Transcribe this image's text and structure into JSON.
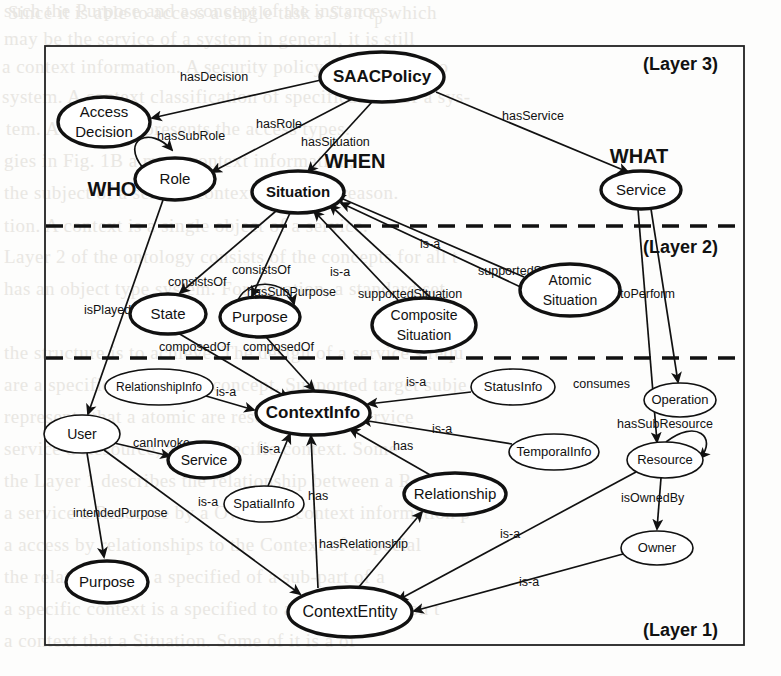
{
  "figure": {
    "width": 781,
    "height": 676,
    "stroke_color": "#111111",
    "fill_color": "#ffffff"
  },
  "layers": [
    {
      "id": "layer3",
      "label": "(Layer 3)",
      "x": 700,
      "y": 64
    },
    {
      "id": "layer2",
      "label": "(Layer 2)",
      "x": 700,
      "y": 247
    },
    {
      "id": "layer1",
      "label": "(Layer 1)",
      "x": 700,
      "y": 630
    }
  ],
  "axis_labels": [
    {
      "id": "who",
      "label": "WHO",
      "x": 112,
      "y": 196
    },
    {
      "id": "when",
      "label": "WHEN",
      "x": 355,
      "y": 168
    },
    {
      "id": "what",
      "label": "WHAT",
      "x": 639,
      "y": 163
    }
  ],
  "nodes": [
    {
      "id": "saacpolicy",
      "label": "SAACPolicy",
      "lines": [
        "SAACPolicy"
      ],
      "cx": 382,
      "cy": 77,
      "rx": 62,
      "ry": 25,
      "weight": "thick",
      "font": 17
    },
    {
      "id": "accessdecision",
      "label": "Access Decision",
      "lines": [
        "Access",
        "Decision"
      ],
      "cx": 104,
      "cy": 122,
      "rx": 46,
      "ry": 25,
      "weight": "thick",
      "font": 15
    },
    {
      "id": "role",
      "label": "Role",
      "lines": [
        "Role"
      ],
      "cx": 175,
      "cy": 179,
      "rx": 40,
      "ry": 21,
      "weight": "thick",
      "font": 15
    },
    {
      "id": "situation",
      "label": "Situation",
      "lines": [
        "Situation"
      ],
      "cx": 298,
      "cy": 192,
      "rx": 46,
      "ry": 21,
      "weight": "thick",
      "font": 15
    },
    {
      "id": "service_l3",
      "label": "Service",
      "lines": [
        "Service"
      ],
      "cx": 641,
      "cy": 190,
      "rx": 40,
      "ry": 19,
      "weight": "thick",
      "font": 15
    },
    {
      "id": "state",
      "label": "State",
      "lines": [
        "State"
      ],
      "cx": 168,
      "cy": 314,
      "rx": 38,
      "ry": 20,
      "weight": "thick",
      "font": 15
    },
    {
      "id": "purpose_l2",
      "label": "Purpose",
      "lines": [
        "Purpose"
      ],
      "cx": 260,
      "cy": 317,
      "rx": 40,
      "ry": 20,
      "weight": "thick",
      "font": 15
    },
    {
      "id": "compositesituation",
      "label": "Composite Situation",
      "lines": [
        "Composite",
        "Situation"
      ],
      "cx": 424,
      "cy": 325,
      "rx": 52,
      "ry": 27,
      "weight": "thick",
      "font": 14
    },
    {
      "id": "atomicsituation",
      "label": "Atomic Situation",
      "lines": [
        "Atomic",
        "Situation"
      ],
      "cx": 570,
      "cy": 290,
      "rx": 50,
      "ry": 26,
      "weight": "thick",
      "font": 14
    },
    {
      "id": "operation",
      "label": "Operation",
      "lines": [
        "Operation"
      ],
      "cx": 680,
      "cy": 400,
      "rx": 36,
      "ry": 17,
      "weight": "thin",
      "font": 13
    },
    {
      "id": "relationshipinfo",
      "label": "RelationshipInfo",
      "lines": [
        "RelationshipInfo"
      ],
      "cx": 159,
      "cy": 387,
      "rx": 54,
      "ry": 18,
      "weight": "thin",
      "font": 12
    },
    {
      "id": "contextinfo",
      "label": "ContextInfo",
      "lines": [
        "ContextInfo"
      ],
      "cx": 313,
      "cy": 413,
      "rx": 57,
      "ry": 22,
      "weight": "thick",
      "font": 17
    },
    {
      "id": "statusinfo",
      "label": "StatusInfo",
      "lines": [
        "StatusInfo"
      ],
      "cx": 513,
      "cy": 387,
      "rx": 42,
      "ry": 18,
      "weight": "thin",
      "font": 13
    },
    {
      "id": "user",
      "label": "User",
      "lines": [
        "User"
      ],
      "cx": 82,
      "cy": 434,
      "rx": 38,
      "ry": 19,
      "weight": "thin",
      "font": 14
    },
    {
      "id": "service_l1",
      "label": "Service",
      "lines": [
        "Service"
      ],
      "cx": 204,
      "cy": 460,
      "rx": 36,
      "ry": 18,
      "weight": "thick",
      "font": 14
    },
    {
      "id": "temporalinfo",
      "label": "TemporalInfo",
      "lines": [
        "TemporalInfo"
      ],
      "cx": 554,
      "cy": 452,
      "rx": 45,
      "ry": 18,
      "weight": "thin",
      "font": 13
    },
    {
      "id": "resource",
      "label": "Resource",
      "lines": [
        "Resource"
      ],
      "cx": 665,
      "cy": 460,
      "rx": 38,
      "ry": 18,
      "weight": "thin",
      "font": 13
    },
    {
      "id": "spatialinfo",
      "label": "SpatialInfo",
      "lines": [
        "SpatialInfo"
      ],
      "cx": 264,
      "cy": 504,
      "rx": 40,
      "ry": 18,
      "weight": "thin",
      "font": 13
    },
    {
      "id": "relationship",
      "label": "Relationship",
      "lines": [
        "Relationship"
      ],
      "cx": 455,
      "cy": 494,
      "rx": 51,
      "ry": 21,
      "weight": "thick",
      "font": 15
    },
    {
      "id": "owner",
      "label": "Owner",
      "lines": [
        "Owner"
      ],
      "cx": 657,
      "cy": 548,
      "rx": 36,
      "ry": 17,
      "weight": "thin",
      "font": 13
    },
    {
      "id": "purpose_l1",
      "label": "Purpose",
      "lines": [
        "Purpose"
      ],
      "cx": 107,
      "cy": 582,
      "rx": 41,
      "ry": 21,
      "weight": "thick",
      "font": 15
    },
    {
      "id": "contextentity",
      "label": "ContextEntity",
      "lines": [
        "ContextEntity"
      ],
      "cx": 350,
      "cy": 612,
      "rx": 62,
      "ry": 25,
      "weight": "thick",
      "font": 16
    }
  ],
  "edges": [
    {
      "id": "e1",
      "label": "hasDecision",
      "from": "saacpolicy",
      "to": "accessdecision",
      "lx": 180,
      "ly": 78
    },
    {
      "id": "e2",
      "label": "hasRole",
      "from": "saacpolicy",
      "to": "role",
      "lx": 256,
      "ly": 125
    },
    {
      "id": "e3",
      "label": "hasSituation",
      "from": "saacpolicy",
      "to": "situation",
      "lx": 301,
      "ly": 143
    },
    {
      "id": "e4",
      "label": "hasService",
      "from": "saacpolicy",
      "to": "service_l3",
      "lx": 502,
      "ly": 117
    },
    {
      "id": "e5",
      "label": "hasSubRole",
      "from": "role",
      "to": "role",
      "lx": 157,
      "ly": 137,
      "self": true
    },
    {
      "id": "e6",
      "label": "isPlayedBy",
      "from": "role",
      "to": "user",
      "lx": 84,
      "ly": 311
    },
    {
      "id": "e7",
      "label": "consistsOf",
      "from": "situation",
      "to": "state",
      "lx": 168,
      "ly": 283
    },
    {
      "id": "e8",
      "label": "consistsOf",
      "from": "situation",
      "to": "purpose_l2",
      "lx": 232,
      "ly": 271
    },
    {
      "id": "e9",
      "label": "hasSubPurpose",
      "from": "purpose_l2",
      "to": "purpose_l2",
      "lx": 247,
      "ly": 293,
      "self": true
    },
    {
      "id": "e10",
      "label": "is-a",
      "from": "compositesituation",
      "to": "situation",
      "lx": 330,
      "ly": 273
    },
    {
      "id": "e11",
      "label": "supportedSituation",
      "from": "compositesituation",
      "to": "situation",
      "lx": 358,
      "ly": 295
    },
    {
      "id": "e12",
      "label": "is-a",
      "from": "atomicsituation",
      "to": "situation",
      "lx": 420,
      "ly": 245
    },
    {
      "id": "e13",
      "label": "supportedSituation",
      "from": "atomicsituation",
      "to": "situation",
      "lx": 478,
      "ly": 272
    },
    {
      "id": "e14",
      "label": "toPerform",
      "from": "service_l3",
      "to": "operation",
      "lx": 620,
      "ly": 295
    },
    {
      "id": "e15",
      "label": "consumes",
      "from": "service_l3",
      "to": "resource",
      "lx": 573,
      "ly": 385
    },
    {
      "id": "e16",
      "label": "composedOf",
      "from": "state",
      "to": "contextinfo",
      "lx": 159,
      "ly": 348
    },
    {
      "id": "e17",
      "label": "composedOf",
      "from": "purpose_l2",
      "to": "contextinfo",
      "lx": 243,
      "ly": 348
    },
    {
      "id": "e18",
      "label": "is-a",
      "from": "relationshipinfo",
      "to": "contextinfo",
      "lx": 216,
      "ly": 393
    },
    {
      "id": "e19",
      "label": "is-a",
      "from": "statusinfo",
      "to": "contextinfo",
      "lx": 406,
      "ly": 383
    },
    {
      "id": "e20",
      "label": "is-a",
      "from": "temporalinfo",
      "to": "contextinfo",
      "lx": 432,
      "ly": 430
    },
    {
      "id": "e21",
      "label": "is-a",
      "from": "spatialinfo",
      "to": "contextinfo",
      "lx": 260,
      "ly": 450
    },
    {
      "id": "e22",
      "label": "has",
      "from": "contextentity",
      "to": "contextinfo",
      "lx": 308,
      "ly": 497
    },
    {
      "id": "e23",
      "label": "has",
      "from": "relationship",
      "to": "contextinfo",
      "lx": 393,
      "ly": 447
    },
    {
      "id": "e24",
      "label": "canInvoke",
      "from": "user",
      "to": "service_l1",
      "lx": 133,
      "ly": 444
    },
    {
      "id": "e25",
      "label": "intendedPurpose",
      "from": "user",
      "to": "purpose_l1",
      "lx": 73,
      "ly": 514
    },
    {
      "id": "e26",
      "label": "is-a",
      "from": "user",
      "to": "contextentity",
      "lx": 198,
      "ly": 503
    },
    {
      "id": "e27",
      "label": "hasRelationship",
      "from": "contextentity",
      "to": "relationship",
      "lx": 319,
      "ly": 545
    },
    {
      "id": "e28",
      "label": "hasSubResource",
      "from": "resource",
      "to": "resource",
      "lx": 617,
      "ly": 425,
      "self": true
    },
    {
      "id": "e29",
      "label": "isOwnedBy",
      "from": "resource",
      "to": "owner",
      "lx": 621,
      "ly": 499
    },
    {
      "id": "e30",
      "label": "is-a",
      "from": "resource",
      "to": "contextentity",
      "lx": 500,
      "ly": 535
    },
    {
      "id": "e31",
      "label": "is-a",
      "from": "owner",
      "to": "contextentity",
      "lx": 519,
      "ly": 583
    }
  ],
  "dividers": [
    {
      "id": "divider-3-2",
      "y": 226
    },
    {
      "id": "divider-2-1",
      "y": 358
    }
  ]
}
